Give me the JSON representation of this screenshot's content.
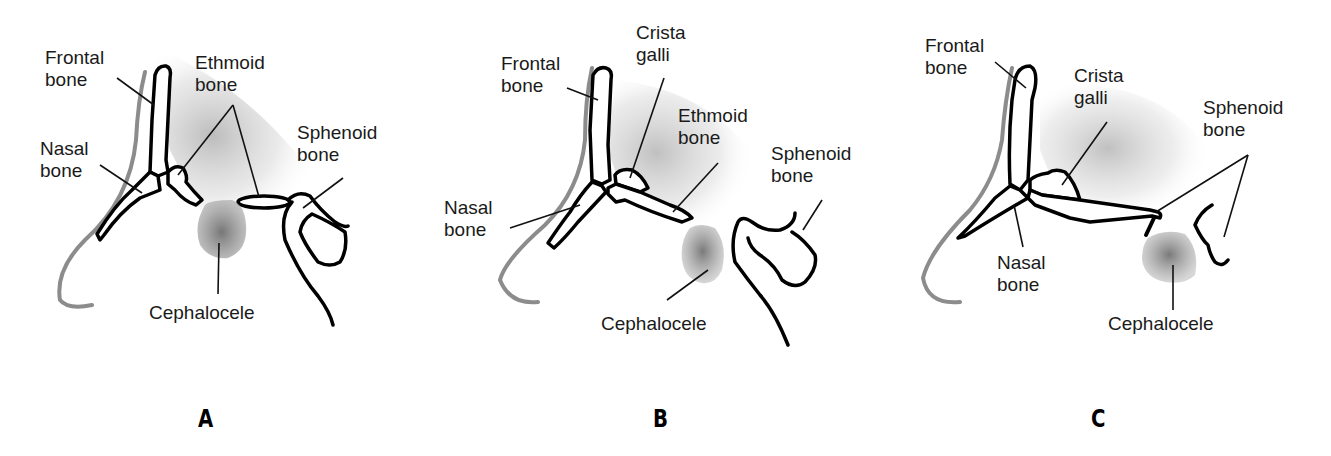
{
  "figure": {
    "panels": [
      {
        "letter": "A",
        "labels": {
          "frontal": "Frontal\nbone",
          "ethmoid": "Ethmoid\nbone",
          "nasal": "Nasal\nbone",
          "sphenoid": "Sphenoid\nbone",
          "cephalocele": "Cephalocele"
        }
      },
      {
        "letter": "B",
        "labels": {
          "frontal": "Frontal\nbone",
          "crista": "Crista\ngalli",
          "ethmoid": "Ethmoid\nbone",
          "nasal": "Nasal\nbone",
          "sphenoid": "Sphenoid\nbone",
          "cephalocele": "Cephalocele"
        }
      },
      {
        "letter": "C",
        "labels": {
          "frontal": "Frontal\nbone",
          "crista": "Crista\ngalli",
          "sphenoid": "Sphenoid\nbone",
          "nasal": "Nasal\nbone",
          "cephalocele": "Cephalocele"
        }
      }
    ],
    "colors": {
      "outline": "#000000",
      "skin_line": "#8c8c8c",
      "shading": "#bdbdbd",
      "cephalocele": "#8a8a8a"
    }
  }
}
